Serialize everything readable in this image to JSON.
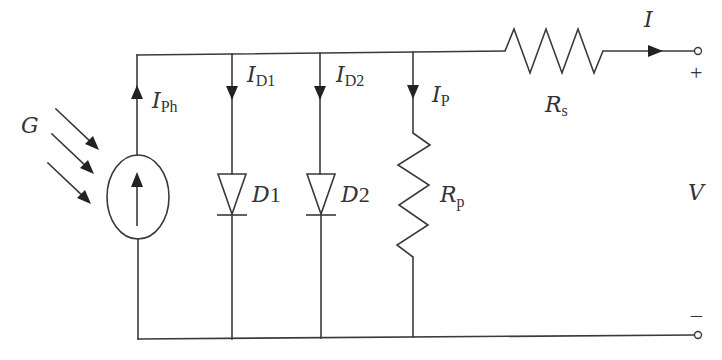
{
  "diagram": {
    "type": "circuit",
    "labels": {
      "irradiance": "G",
      "photocurrent": {
        "main": "I",
        "sub": "Ph"
      },
      "diode1_current": {
        "main": "I",
        "sub": "D1"
      },
      "diode2_current": {
        "main": "I",
        "sub": "D2"
      },
      "parallel_current": {
        "main": "I",
        "sub": "P"
      },
      "diode1": {
        "main": "D",
        "num": "1"
      },
      "diode2": {
        "main": "D",
        "num": "2"
      },
      "parallel_resistor": {
        "main": "R",
        "sub": "p"
      },
      "series_resistor": {
        "main": "R",
        "sub": "s"
      },
      "output_current": "I",
      "voltage": "V",
      "plus": "+",
      "minus": "–"
    },
    "components": [
      {
        "id": "current_source",
        "kind": "current-source",
        "label": "IPh"
      },
      {
        "id": "D1",
        "kind": "diode",
        "label": "D1"
      },
      {
        "id": "D2",
        "kind": "diode",
        "label": "D2"
      },
      {
        "id": "Rp",
        "kind": "resistor",
        "label": "Rp"
      },
      {
        "id": "Rs",
        "kind": "resistor",
        "label": "Rs"
      }
    ],
    "colors": {
      "line": "#3a3a3a",
      "text": "#333333",
      "background": "#ffffff"
    }
  }
}
